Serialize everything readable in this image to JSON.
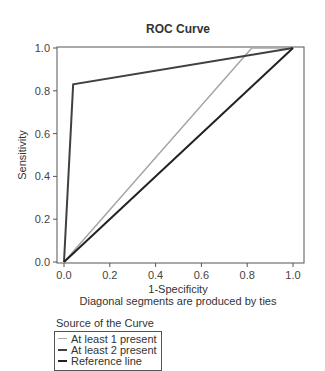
{
  "chart_data": {
    "type": "line",
    "title": "ROC Curve",
    "xlabel": "1-Specificity",
    "ylabel": "Sensitivity",
    "footnote": "Diagonal segments are produced by ties",
    "xlim": [
      0,
      1
    ],
    "ylim": [
      0,
      1
    ],
    "xticks": [
      "0.0",
      "0.2",
      "0.4",
      "0.6",
      "0.8",
      "1.0"
    ],
    "yticks": [
      "0.0",
      "0.2",
      "0.4",
      "0.6",
      "0.8",
      "1.0"
    ],
    "grid": false,
    "legend_title": "Source of the Curve",
    "legend_position": "bottom-left",
    "series": [
      {
        "name": "At least 1 present",
        "color": "#a6a6a6",
        "points": [
          [
            0,
            0
          ],
          [
            0.82,
            1.0
          ],
          [
            1.0,
            1.0
          ]
        ]
      },
      {
        "name": "At least 2 present",
        "color": "#404040",
        "points": [
          [
            0,
            0
          ],
          [
            0.04,
            0.83
          ],
          [
            1.0,
            1.0
          ]
        ]
      },
      {
        "name": "Reference line",
        "color": "#222222",
        "points": [
          [
            0,
            0
          ],
          [
            1.0,
            1.0
          ]
        ]
      }
    ]
  }
}
